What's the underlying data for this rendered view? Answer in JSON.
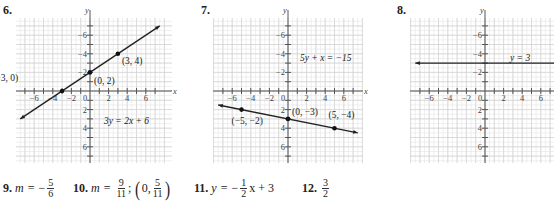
{
  "problems": [
    {
      "number": "6.",
      "equation": "3y = 2x + 6",
      "points": [
        {
          "label": "(−3, 0)",
          "x": -3,
          "y": 0
        },
        {
          "label": "(0, 2)",
          "x": 0,
          "y": 2
        },
        {
          "label": "(3, 4)",
          "x": 3,
          "y": 4
        }
      ]
    },
    {
      "number": "7.",
      "equation": "5y + x = −15",
      "points": [
        {
          "label": "(−5, −2)",
          "x": -5,
          "y": -2
        },
        {
          "label": "(0, −3)",
          "x": 0,
          "y": -3
        },
        {
          "label": "(5, −4)",
          "x": 5,
          "y": -4
        }
      ]
    },
    {
      "number": "8.",
      "equation": "y = 3",
      "points": []
    }
  ],
  "axes": {
    "x_label": "x",
    "y_label": "y",
    "x_ticks": [
      "−6",
      "−4",
      "−2",
      "0",
      "2",
      "4",
      "6"
    ],
    "y_ticks": [
      "6",
      "4",
      "2",
      "−2",
      "−4",
      "−6"
    ]
  },
  "answers": {
    "a9": {
      "num": "9.",
      "lhs": "m",
      "eq": "=",
      "sign": "−",
      "frac_n": "5",
      "frac_d": "6"
    },
    "a10": {
      "num": "10.",
      "lhs": "m",
      "eq": "=",
      "frac_n": "9",
      "frac_d": "11",
      "sep": ";",
      "pt_x": "0,",
      "pt_frac_n": "5",
      "pt_frac_d": "11"
    },
    "a11": {
      "num": "11.",
      "lhs": "y",
      "eq": "=",
      "sign": "−",
      "frac_n": "1",
      "frac_d": "2",
      "rest": "x + 3"
    },
    "a12": {
      "num": "12.",
      "frac_n": "3",
      "frac_d": "2"
    }
  },
  "chart_data": [
    {
      "type": "line",
      "title": "6.",
      "annotation": "3y = 2x + 6",
      "x": [
        -7.5,
        -3,
        0,
        3,
        7.5
      ],
      "series": [
        {
          "name": "3y = 2x + 6",
          "values": [
            -3,
            0,
            2,
            4,
            7
          ]
        }
      ],
      "points": [
        [
          -3,
          0
        ],
        [
          0,
          2
        ],
        [
          3,
          4
        ]
      ],
      "xlabel": "x",
      "ylabel": "y",
      "xlim": [
        -8,
        8
      ],
      "ylim": [
        -8,
        8
      ],
      "x_ticks": [
        -6,
        -4,
        -2,
        0,
        2,
        4,
        6
      ],
      "y_ticks": [
        -6,
        -4,
        -2,
        2,
        4,
        6
      ],
      "grid": true
    },
    {
      "type": "line",
      "title": "7.",
      "annotation": "5y + x = −15",
      "x": [
        -7.5,
        -5,
        0,
        5,
        7.5
      ],
      "series": [
        {
          "name": "5y + x = −15",
          "values": [
            -1.5,
            -2,
            -3,
            -4,
            -4.5
          ]
        }
      ],
      "points": [
        [
          -5,
          -2
        ],
        [
          0,
          -3
        ],
        [
          5,
          -4
        ]
      ],
      "xlabel": "x",
      "ylabel": "y",
      "xlim": [
        -8,
        8
      ],
      "ylim": [
        -8,
        8
      ],
      "x_ticks": [
        -6,
        -4,
        -2,
        0,
        2,
        4,
        6
      ],
      "y_ticks": [
        -6,
        -4,
        -2,
        2,
        4,
        6
      ],
      "grid": true
    },
    {
      "type": "line",
      "title": "8.",
      "annotation": "y = 3",
      "x": [
        -7.5,
        7.5
      ],
      "series": [
        {
          "name": "y = 3",
          "values": [
            3,
            3
          ]
        }
      ],
      "xlabel": "x",
      "ylabel": "y",
      "xlim": [
        -8,
        8
      ],
      "ylim": [
        -8,
        8
      ],
      "x_ticks": [
        -6,
        -4,
        -2,
        0,
        2,
        4,
        6
      ],
      "y_ticks": [
        -6,
        -4,
        -2,
        2,
        4,
        6
      ],
      "grid": true
    }
  ]
}
